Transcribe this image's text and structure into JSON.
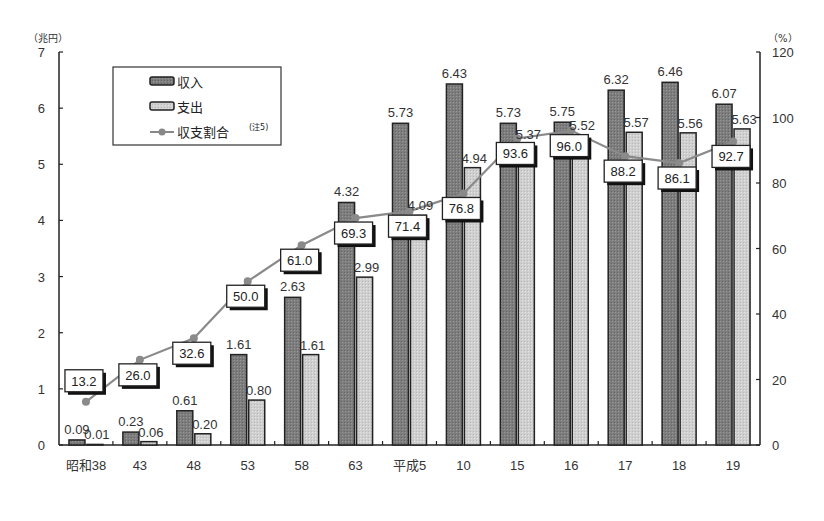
{
  "chart_data": {
    "type": "bar",
    "title": "",
    "xlabel": "",
    "ylabel": "（兆円）",
    "y2label": "（%）",
    "categories": [
      "昭和38",
      "43",
      "48",
      "53",
      "58",
      "63",
      "平成5",
      "10",
      "15",
      "16",
      "17",
      "18",
      "19"
    ],
    "series": [
      {
        "name": "収入",
        "kind": "bar",
        "axis": "left",
        "color": "#7a7a7a",
        "values": [
          0.09,
          0.23,
          0.61,
          1.61,
          2.63,
          4.32,
          5.73,
          6.43,
          5.73,
          5.75,
          6.32,
          6.46,
          6.07
        ]
      },
      {
        "name": "支出",
        "kind": "bar",
        "axis": "left",
        "color": "#c8c8c8",
        "values": [
          0.01,
          0.06,
          0.2,
          0.8,
          1.61,
          2.99,
          4.09,
          4.94,
          5.37,
          5.52,
          5.57,
          5.56,
          5.63
        ]
      },
      {
        "name": "収支割合",
        "note": "(注5)",
        "kind": "line",
        "axis": "right",
        "color": "#8a8a8a",
        "values": [
          13.2,
          26.0,
          32.6,
          50.0,
          61.0,
          69.3,
          71.4,
          76.8,
          93.6,
          96.0,
          88.2,
          86.1,
          92.7
        ]
      }
    ],
    "ylim": [
      0,
      7
    ],
    "yticks": [
      0,
      1,
      2,
      3,
      4,
      5,
      6,
      7
    ],
    "y2lim": [
      0,
      120
    ],
    "y2ticks": [
      0,
      20,
      40,
      60,
      80,
      100,
      120
    ],
    "grid": false,
    "legend_position": "upper-left"
  },
  "legend": {
    "income": "収入",
    "expense": "支出",
    "ratio": "収支割合",
    "ratio_note": "(注5)"
  },
  "axes": {
    "left_unit": "（兆円）",
    "right_unit": "（%）"
  }
}
